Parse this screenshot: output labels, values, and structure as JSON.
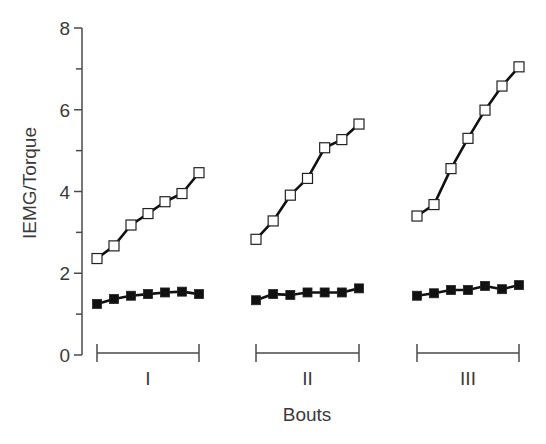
{
  "chart_data": {
    "type": "line",
    "title": "",
    "xlabel": "Bouts",
    "ylabel": "IEMG/Torque",
    "ylim": [
      0,
      8
    ],
    "yticks_major": [
      0,
      2,
      4,
      6,
      8
    ],
    "yticks_minor": [
      1,
      3,
      5,
      7
    ],
    "grid": false,
    "legend": null,
    "groups": [
      "I",
      "II",
      "III"
    ],
    "points_per_group": 7,
    "series": [
      {
        "name": "open-squares",
        "marker": "open-square",
        "color": "#1a1a1a",
        "values": {
          "I": [
            2.36,
            2.67,
            3.18,
            3.46,
            3.75,
            3.95,
            4.46
          ],
          "II": [
            2.83,
            3.28,
            3.91,
            4.32,
            5.07,
            5.27,
            5.65
          ],
          "III": [
            3.4,
            3.68,
            4.56,
            5.3,
            5.99,
            6.58,
            7.05
          ]
        }
      },
      {
        "name": "filled-squares",
        "marker": "filled-square",
        "color": "#111111",
        "values": {
          "I": [
            1.25,
            1.37,
            1.45,
            1.49,
            1.53,
            1.55,
            1.49
          ],
          "II": [
            1.34,
            1.49,
            1.47,
            1.53,
            1.53,
            1.53,
            1.63
          ],
          "III": [
            1.45,
            1.51,
            1.59,
            1.59,
            1.69,
            1.61,
            1.71
          ]
        }
      }
    ]
  },
  "axis": {
    "y_label": "IEMG/Torque",
    "x_label": "Bouts",
    "y_tick_labels": [
      "0",
      "2",
      "4",
      "6",
      "8"
    ]
  },
  "brackets": [
    {
      "label": "I",
      "x_start": 97,
      "x_end": 199
    },
    {
      "label": "II",
      "x_start": 256,
      "x_end": 359
    },
    {
      "label": "III",
      "x_start": 417,
      "x_end": 519
    }
  ],
  "colors": {
    "axis": "#4a4a4a",
    "line": "#111111",
    "marker_fill_open": "#ffffff",
    "marker_fill_filled": "#111111",
    "background": "#ffffff"
  }
}
